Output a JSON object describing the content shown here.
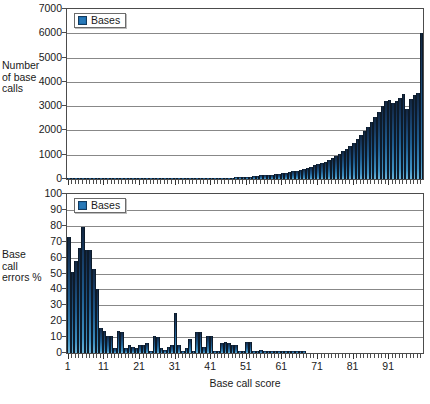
{
  "chart_data": [
    {
      "id": "base-call-counts",
      "type": "bar",
      "title": "",
      "xlabel": "",
      "ylabel": "Number of base calls",
      "ylabel_lines": "Number\nof base\ncalls",
      "legend": [
        "Bases"
      ],
      "legend_position": "top-left",
      "grid": true,
      "ylim": [
        0,
        7000
      ],
      "yticks": [
        0,
        1000,
        2000,
        3000,
        4000,
        5000,
        6000,
        7000
      ],
      "xlim": [
        1,
        100
      ],
      "xticks": [
        1,
        11,
        21,
        31,
        41,
        51,
        61,
        71,
        81,
        91
      ],
      "series_color": "#1f5f93",
      "x": [
        1,
        2,
        3,
        4,
        5,
        6,
        7,
        8,
        9,
        10,
        11,
        12,
        13,
        14,
        15,
        16,
        17,
        18,
        19,
        20,
        21,
        22,
        23,
        24,
        25,
        26,
        27,
        28,
        29,
        30,
        31,
        32,
        33,
        34,
        35,
        36,
        37,
        38,
        39,
        40,
        41,
        42,
        43,
        44,
        45,
        46,
        47,
        48,
        49,
        50,
        51,
        52,
        53,
        54,
        55,
        56,
        57,
        58,
        59,
        60,
        61,
        62,
        63,
        64,
        65,
        66,
        67,
        68,
        69,
        70,
        71,
        72,
        73,
        74,
        75,
        76,
        77,
        78,
        79,
        80,
        81,
        82,
        83,
        84,
        85,
        86,
        87,
        88,
        89,
        90,
        91,
        92,
        93,
        94,
        95,
        96,
        97,
        98,
        99,
        100
      ],
      "values": [
        12,
        10,
        8,
        9,
        7,
        8,
        7,
        6,
        8,
        7,
        6,
        7,
        6,
        5,
        6,
        5,
        6,
        5,
        6,
        5,
        6,
        5,
        6,
        5,
        6,
        6,
        5,
        6,
        6,
        7,
        6,
        7,
        7,
        8,
        8,
        9,
        9,
        10,
        11,
        12,
        14,
        16,
        20,
        30,
        45,
        55,
        60,
        70,
        80,
        85,
        95,
        100,
        115,
        130,
        150,
        150,
        165,
        180,
        190,
        210,
        235,
        255,
        280,
        310,
        340,
        370,
        420,
        470,
        510,
        560,
        620,
        680,
        720,
        800,
        880,
        960,
        1050,
        1150,
        1250,
        1380,
        1500,
        1650,
        1800,
        1980,
        2150,
        2350,
        2560,
        2780,
        3000,
        3200,
        3250,
        3150,
        3200,
        3350,
        3500,
        2900,
        3300,
        3450,
        3550,
        6000
      ]
    },
    {
      "id": "base-call-errors",
      "type": "bar",
      "title": "",
      "xlabel": "Base call score",
      "ylabel": "Base call errors %",
      "ylabel_lines": "Base\ncall\nerrors %",
      "legend": [
        "Bases"
      ],
      "legend_position": "top-left",
      "grid": true,
      "ylim": [
        0,
        100
      ],
      "yticks": [
        0,
        10,
        20,
        30,
        40,
        50,
        60,
        70,
        80,
        90,
        100
      ],
      "xlim": [
        1,
        100
      ],
      "xticks": [
        1,
        11,
        21,
        31,
        41,
        51,
        61,
        71,
        81,
        91
      ],
      "series_color": "#1f5f93",
      "x": [
        1,
        2,
        3,
        4,
        5,
        6,
        7,
        8,
        9,
        10,
        11,
        12,
        13,
        14,
        15,
        16,
        17,
        18,
        19,
        20,
        21,
        22,
        23,
        24,
        25,
        26,
        27,
        28,
        29,
        30,
        31,
        32,
        33,
        34,
        35,
        36,
        37,
        38,
        39,
        40,
        41,
        42,
        43,
        44,
        45,
        46,
        47,
        48,
        49,
        50,
        51,
        52,
        53,
        54,
        55,
        56,
        57,
        58,
        59,
        60,
        61,
        62,
        63,
        64,
        65,
        66,
        67,
        68,
        69,
        70,
        71,
        72,
        73,
        74,
        75,
        76,
        77,
        78,
        79,
        80,
        81,
        82,
        83,
        84,
        85,
        86,
        87,
        88,
        89,
        90,
        91,
        92,
        93,
        94,
        95,
        96,
        97,
        98,
        99,
        100
      ],
      "values": [
        73,
        51,
        58,
        66,
        79,
        65,
        65,
        53,
        40,
        16,
        14,
        11,
        11,
        3,
        14,
        13,
        3,
        5,
        4,
        3,
        5,
        5,
        6,
        1,
        11,
        10,
        3,
        2,
        4,
        5,
        25,
        5,
        1,
        3,
        9,
        1,
        13,
        13,
        4,
        11,
        11,
        1,
        1,
        6,
        7,
        6,
        5,
        5,
        1,
        1,
        7,
        7,
        1,
        1,
        2,
        1,
        1,
        1,
        1,
        1,
        1,
        1,
        1,
        1,
        1,
        1,
        1,
        0,
        0,
        0,
        0,
        0,
        0,
        0,
        0,
        0,
        0,
        0,
        0,
        0,
        0,
        0,
        0,
        0,
        0,
        0,
        0,
        0,
        0,
        0,
        0,
        0,
        0,
        0,
        0,
        0,
        0,
        0,
        0,
        0
      ]
    }
  ]
}
